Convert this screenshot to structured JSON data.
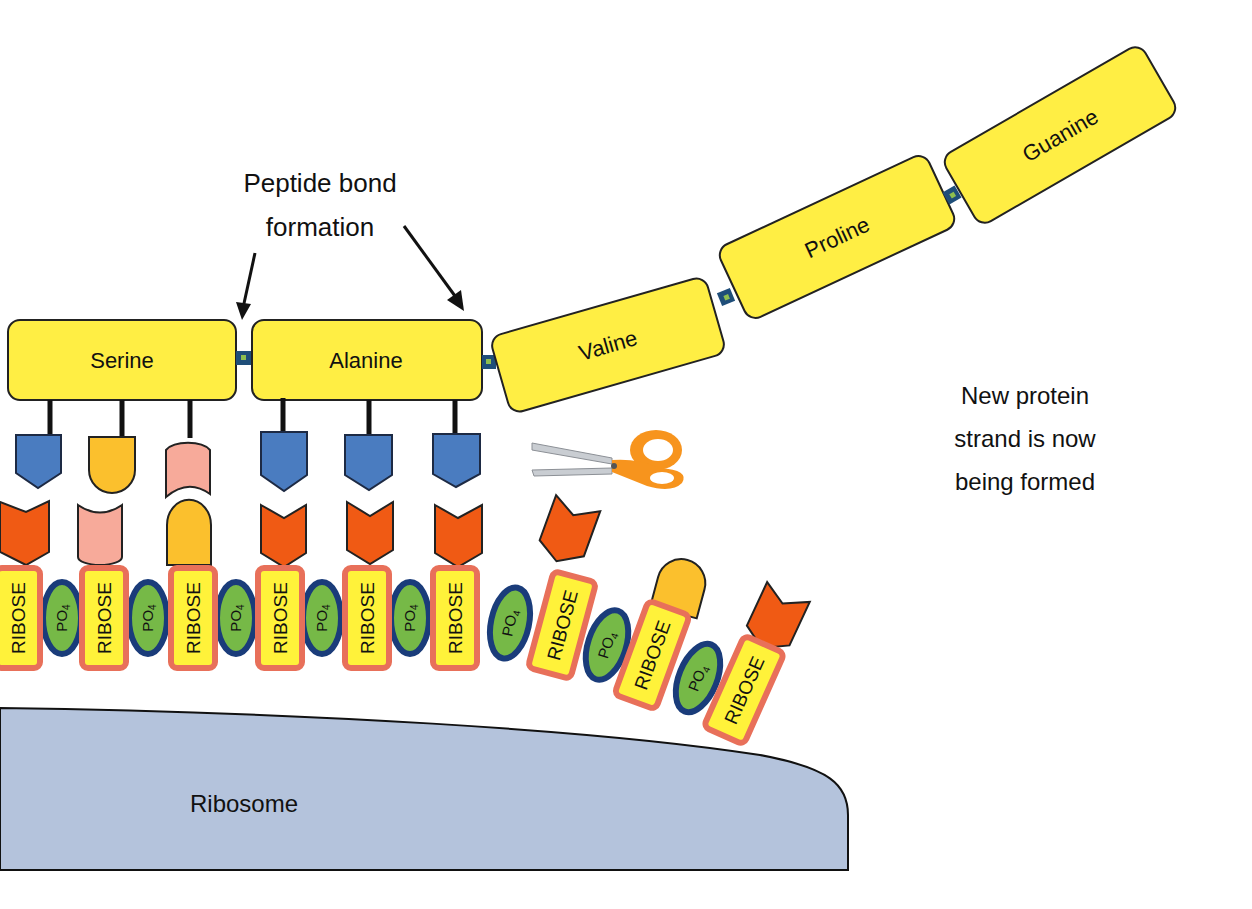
{
  "diagram": {
    "annotation_peptide": [
      "Peptide bond",
      "formation"
    ],
    "annotation_protein": [
      "New protein",
      "strand is now",
      "being formed"
    ],
    "ribosome_label": "Ribosome",
    "amino_acids": [
      "Serine",
      "Alanine",
      "Valine",
      "Proline",
      "Guanine"
    ],
    "ribose_label": "RIBOSE",
    "phosphate_label": "PO",
    "phosphate_subscript": "4",
    "scissors_icon": "scissors-icon",
    "colors": {
      "amino_acid": "#ffee44",
      "ribose_fill": "#fff23a",
      "ribose_border": "#e8705a",
      "phosphate_fill": "#76b947",
      "phosphate_border": "#1a3c7a",
      "ribosome": "#b4c3dc",
      "base_blue": "#4a7cc0",
      "base_orange": "#f05a14",
      "base_yellow": "#fbc02d",
      "base_pink": "#f7aa9a"
    }
  }
}
